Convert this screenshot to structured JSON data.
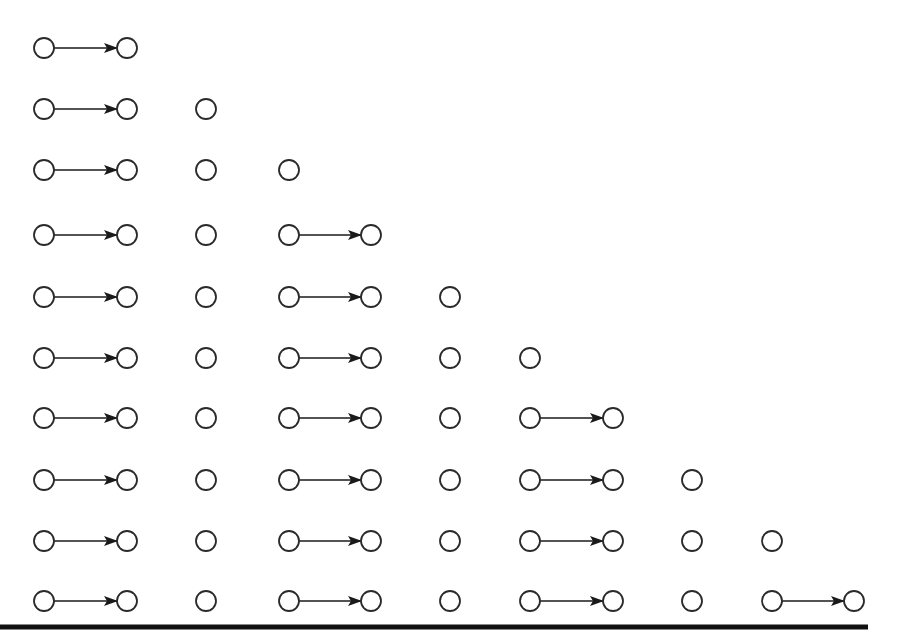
{
  "diagram": {
    "title": "",
    "colors": {
      "stroke": "#2a2a2a",
      "arrow": "#1a1a1a",
      "baseline": "#111111",
      "background": "#ffffff"
    },
    "node_radius": 10,
    "column_x": [
      44,
      127,
      206,
      289,
      371,
      450,
      530,
      613,
      692,
      772,
      854
    ],
    "row_y": [
      48,
      109,
      170,
      235,
      297,
      358,
      418,
      480,
      541,
      601
    ],
    "rows": [
      {
        "groups": [
          [
            0,
            1
          ]
        ]
      },
      {
        "groups": [
          [
            0,
            1
          ],
          [
            2
          ]
        ]
      },
      {
        "groups": [
          [
            0,
            1
          ],
          [
            2
          ],
          [
            3
          ]
        ]
      },
      {
        "groups": [
          [
            0,
            1
          ],
          [
            2
          ],
          [
            3,
            4
          ]
        ]
      },
      {
        "groups": [
          [
            0,
            1
          ],
          [
            2
          ],
          [
            3,
            4
          ],
          [
            5
          ]
        ]
      },
      {
        "groups": [
          [
            0,
            1
          ],
          [
            2
          ],
          [
            3,
            4
          ],
          [
            5
          ],
          [
            6
          ]
        ]
      },
      {
        "groups": [
          [
            0,
            1
          ],
          [
            2
          ],
          [
            3,
            4
          ],
          [
            5
          ],
          [
            6,
            7
          ]
        ]
      },
      {
        "groups": [
          [
            0,
            1
          ],
          [
            2
          ],
          [
            3,
            4
          ],
          [
            5
          ],
          [
            6,
            7
          ],
          [
            8
          ]
        ]
      },
      {
        "groups": [
          [
            0,
            1
          ],
          [
            2
          ],
          [
            3,
            4
          ],
          [
            5
          ],
          [
            6,
            7
          ],
          [
            8
          ],
          [
            9
          ]
        ]
      },
      {
        "groups": [
          [
            0,
            1
          ],
          [
            2
          ],
          [
            3,
            4
          ],
          [
            5
          ],
          [
            6,
            7
          ],
          [
            8
          ],
          [
            9,
            10
          ]
        ]
      }
    ],
    "baseline": {
      "x1": 0,
      "x2": 868,
      "y": 627,
      "thickness": 5
    }
  }
}
